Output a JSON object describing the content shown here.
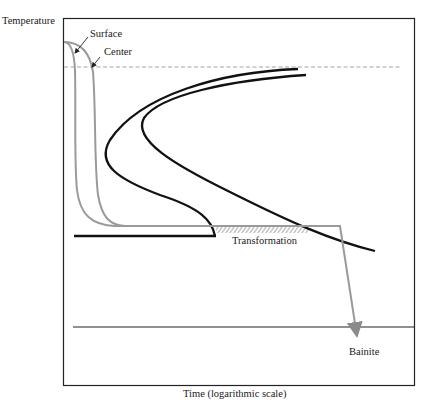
{
  "diagram": {
    "type": "ttt-cooling-diagram",
    "y_axis_label": "Temperature",
    "x_axis_label": "Time (logarithmic scale)",
    "curve_labels": {
      "surface": "Surface",
      "center": "Center"
    },
    "region_labels": {
      "transformation": "Transformation",
      "product": "Bainite"
    },
    "colors": {
      "frame": "#222222",
      "cooling_curves": "#9a9a9a",
      "ttt_curves": "#111111",
      "dashed_line": "#999999",
      "hatching": "#8a8a8a"
    }
  }
}
